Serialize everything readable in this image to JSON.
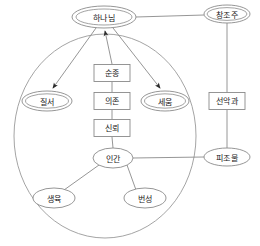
{
  "diagram": {
    "type": "node-link-diagram",
    "colors": {
      "background": "#ffffff",
      "stroke": "#8a8a8a",
      "container_stroke": "#9a9a9a",
      "text": "#1a1a1a",
      "arrow": "#2b2b2b"
    },
    "container": {
      "shape": "ellipse",
      "label": ""
    },
    "nodes": [
      {
        "id": "god",
        "label": "하나님",
        "shape": "double-ellipse",
        "cx": 104,
        "cy": 17,
        "rx": 32,
        "ry": 11
      },
      {
        "id": "creator",
        "label": "창조주",
        "shape": "double-ellipse",
        "cx": 227,
        "cy": 14,
        "rx": 23,
        "ry": 9
      },
      {
        "id": "order",
        "label": "질서",
        "shape": "double-ellipse",
        "cx": 47,
        "cy": 101,
        "rx": 25,
        "ry": 10
      },
      {
        "id": "build",
        "label": "세움",
        "shape": "double-ellipse",
        "cx": 165,
        "cy": 101,
        "rx": 24,
        "ry": 10
      },
      {
        "id": "obedience",
        "label": "순종",
        "shape": "rect",
        "cx": 112,
        "cy": 73,
        "w": 36,
        "h": 17
      },
      {
        "id": "dependence",
        "label": "의존",
        "shape": "rect",
        "cx": 112,
        "cy": 101,
        "w": 36,
        "h": 17
      },
      {
        "id": "trust",
        "label": "신뢰",
        "shape": "rect",
        "cx": 112,
        "cy": 128,
        "w": 36,
        "h": 17
      },
      {
        "id": "human",
        "label": "인간",
        "shape": "ellipse",
        "cx": 113,
        "cy": 158,
        "rx": 20,
        "ry": 10
      },
      {
        "id": "fruit",
        "label": "선악과",
        "shape": "rect",
        "cx": 227,
        "cy": 101,
        "w": 36,
        "h": 17
      },
      {
        "id": "creature",
        "label": "피조물",
        "shape": "ellipse",
        "cx": 227,
        "cy": 157,
        "rx": 23,
        "ry": 9
      },
      {
        "id": "fruitful",
        "label": "생육",
        "shape": "ellipse",
        "cx": 54,
        "cy": 198,
        "rx": 21,
        "ry": 10
      },
      {
        "id": "multiply",
        "label": "번성",
        "shape": "ellipse",
        "cx": 145,
        "cy": 198,
        "rx": 21,
        "ry": 10
      }
    ],
    "edges": [
      {
        "from": "god",
        "to": "creator",
        "arrow": false
      },
      {
        "from": "god",
        "to": "order",
        "arrow": true
      },
      {
        "from": "god",
        "to": "build",
        "arrow": true
      },
      {
        "from": "obedience",
        "to": "god",
        "arrow": true
      },
      {
        "from": "dependence",
        "to": "obedience",
        "arrow": false
      },
      {
        "from": "trust",
        "to": "dependence",
        "arrow": false
      },
      {
        "from": "human",
        "to": "trust",
        "arrow": false
      },
      {
        "from": "human",
        "to": "fruitful",
        "arrow": false
      },
      {
        "from": "human",
        "to": "multiply",
        "arrow": false
      },
      {
        "from": "human",
        "to": "creature",
        "arrow": false
      },
      {
        "from": "creator",
        "to": "fruit",
        "arrow": false
      },
      {
        "from": "fruit",
        "to": "creature",
        "arrow": false
      }
    ]
  }
}
